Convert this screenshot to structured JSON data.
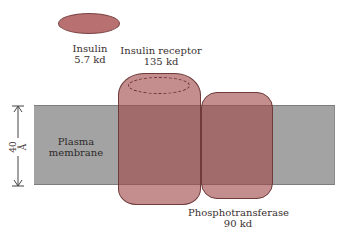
{
  "diagram": {
    "insulin": {
      "name": "Insulin",
      "size": "5.7 kd",
      "color": "#b87070"
    },
    "receptor": {
      "name": "Insulin receptor",
      "size": "135 kd",
      "color": "#a04848"
    },
    "phosphotransferase": {
      "name": "Phosphotransferase",
      "size": "90 kd",
      "color": "#a04848"
    },
    "membrane": {
      "line1": "Plasma",
      "line2": "membrane",
      "color": "#a3a3a3"
    },
    "scale": {
      "label": "40 Å"
    }
  }
}
